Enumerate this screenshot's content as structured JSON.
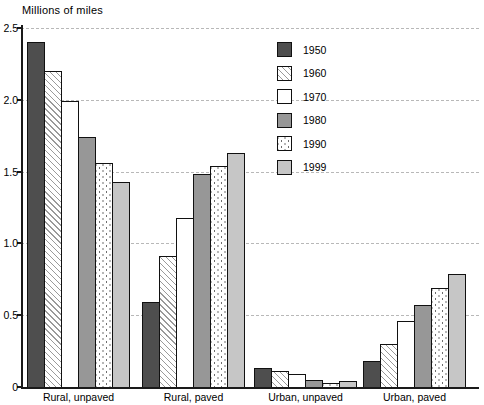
{
  "chart_data": {
    "type": "bar",
    "title": "Millions of miles",
    "ylabel": "Millions of miles",
    "xlabel": "",
    "ylim": [
      0,
      2.5
    ],
    "yticks": [
      "0",
      "0.5",
      "1.0",
      "1.5",
      "2.0",
      "2.5"
    ],
    "grid": true,
    "legend_position": "upper-middle",
    "categories": [
      "Rural, unpaved",
      "Rural, paved",
      "Urban, unpaved",
      "Urban, paved"
    ],
    "series": [
      {
        "name": "1950",
        "style_key": "s1950",
        "pattern": "solid-dark-gray",
        "values": [
          2.4,
          0.59,
          0.13,
          0.18
        ]
      },
      {
        "name": "1960",
        "style_key": "s1960",
        "pattern": "diagonal-hatch",
        "values": [
          2.2,
          0.91,
          0.11,
          0.3
        ]
      },
      {
        "name": "1970",
        "style_key": "s1970",
        "pattern": "white",
        "values": [
          1.99,
          1.18,
          0.09,
          0.46
        ]
      },
      {
        "name": "1980",
        "style_key": "s1980",
        "pattern": "solid-medium-gray",
        "values": [
          1.74,
          1.48,
          0.05,
          0.57
        ]
      },
      {
        "name": "1990",
        "style_key": "s1990",
        "pattern": "stipple-dots",
        "values": [
          1.56,
          1.54,
          0.03,
          0.69
        ]
      },
      {
        "name": "1999",
        "style_key": "s1999",
        "pattern": "solid-light-gray",
        "values": [
          1.43,
          1.63,
          0.04,
          0.79
        ]
      }
    ]
  },
  "legend": {
    "items": [
      "1950",
      "1960",
      "1970",
      "1980",
      "1990",
      "1999"
    ]
  },
  "colors": {
    "series_1950": "#4e4e4e",
    "series_1960_hatch_line": "#9a9a9a",
    "series_1970": "#ffffff",
    "series_1980": "#979797",
    "series_1990_dot": "#6e6e6e",
    "series_1999": "#c6c6c6",
    "gridline": "#b8b8b8",
    "axis": "#1a1a1a"
  }
}
